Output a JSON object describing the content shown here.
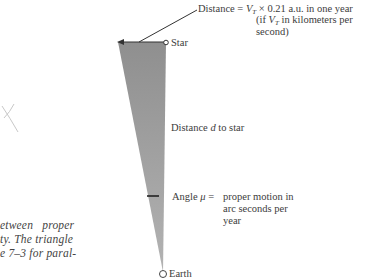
{
  "figure": {
    "top_label": {
      "prefix": "Distance = ",
      "v": "V",
      "v_sub": "T",
      "rest_line1": " × 0.21 a.u. in one year",
      "line2_open": "(if ",
      "line2_v": "V",
      "line2_sub": "T",
      "line2_rest": " in kilometers per",
      "line3": "second)"
    },
    "star_label": "Star",
    "distance_label": {
      "pre": "Distance ",
      "var": "d",
      "post": " to star"
    },
    "angle_label": {
      "pre": "Angle ",
      "var": "μ",
      "eq": " = ",
      "line1": "proper motion in",
      "line2": "arc seconds per",
      "line3": "year"
    },
    "earth_label": "Earth",
    "colors": {
      "triangle_fill": "#9a9a9a",
      "line": "#333333"
    }
  },
  "caption": {
    "lines": [
      "etween   proper",
      "ty. The triangle",
      "e 7–3 for paral-"
    ]
  }
}
